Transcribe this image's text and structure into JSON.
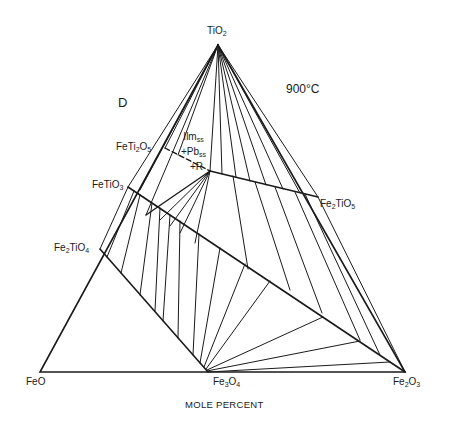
{
  "figure": {
    "panel_label": "D",
    "temperature": "900°C",
    "axis_caption": "MOLE PERCENT",
    "line_color": "#1a1a1a",
    "background": "#ffffff"
  },
  "vertices": {
    "top": {
      "formula": "TiO",
      "sub": "2"
    },
    "bottom_left": {
      "formula": "FeO"
    },
    "bottom_right": {
      "formula": "Fe",
      "sub1": "2",
      "mid": "O",
      "sub2": "3"
    }
  },
  "compounds": {
    "fe3o4": {
      "a": "Fe",
      "s1": "3",
      "b": "O",
      "s2": "4"
    },
    "feti2o5": {
      "a": "FeTi",
      "s1": "2",
      "b": "O",
      "s2": "5"
    },
    "fetio3": {
      "a": "FeTiO",
      "s1": "3"
    },
    "fe2tio4": {
      "a": "Fe",
      "s1": "2",
      "b": "TiO",
      "s2": "4"
    },
    "fe2tio5": {
      "a": "Fe",
      "s1": "2",
      "b": "TiO",
      "s2": "5"
    }
  },
  "phase_field": {
    "line1": {
      "a": "Ilm",
      "s": "ss"
    },
    "line2": {
      "a": "+Pb",
      "s": "ss"
    },
    "line3": "+R"
  },
  "geometry": {
    "TiO2": [
      218,
      45
    ],
    "FeO": [
      40,
      372
    ],
    "Fe2O3": [
      405,
      372
    ],
    "Fe3O4": [
      208,
      372
    ],
    "FeTi2O5": [
      165,
      148
    ],
    "FeTiO3": [
      128,
      187
    ],
    "Fe2TiO4": [
      100,
      249
    ],
    "Fe2TiO5": [
      318,
      197
    ],
    "three_phase_point": [
      210,
      171
    ]
  }
}
